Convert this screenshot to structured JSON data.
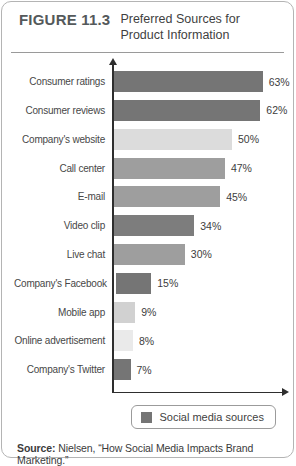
{
  "figure_header": {
    "label": "FIGURE 11.3",
    "title_lines": [
      "Preferred Sources for",
      "Product Information"
    ]
  },
  "chart_data": {
    "type": "bar",
    "orientation": "horizontal",
    "title": "Preferred Sources for Product Information",
    "categories": [
      "Consumer ratings",
      "Consumer reviews",
      "Company's website",
      "Call center",
      "E-mail",
      "Video clip",
      "Live chat",
      "Company's Facebook",
      "Mobile app",
      "Online advertisement",
      "Company's Twitter"
    ],
    "values": [
      63,
      62,
      50,
      47,
      45,
      34,
      30,
      15,
      9,
      8,
      7
    ],
    "value_labels": [
      "63%",
      "62%",
      "50%",
      "47%",
      "45%",
      "34%",
      "30%",
      "15%",
      "9%",
      "8%",
      "7%"
    ],
    "bar_colors": [
      "#757575",
      "#757575",
      "#dcdcdc",
      "#9e9e9e",
      "#9e9e9e",
      "#7d7d7d",
      "#9e9e9e",
      "#757575",
      "#d1d1d1",
      "#eaeaea",
      "#757575"
    ],
    "xlim": [
      0,
      70
    ],
    "grid": false,
    "axis_color": "#2e2e2e",
    "legend": {
      "label": "Social media sources",
      "swatch_color": "#757575",
      "position": "bottom"
    }
  },
  "source_line": {
    "prefix": "Source:",
    "text": " Nielsen, “How Social Media Impacts Brand Marketing.”"
  }
}
